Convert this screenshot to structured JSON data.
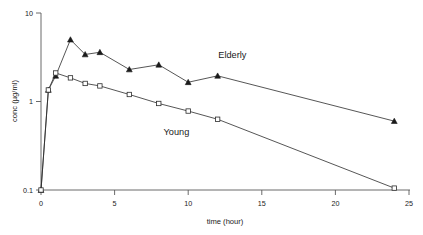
{
  "chart_data": {
    "type": "line",
    "title": "",
    "xlabel": "time (hour)",
    "ylabel": "conc (µg/ml)",
    "yscale": "log",
    "xscale": "linear",
    "xlim": [
      0,
      25
    ],
    "ylim": [
      0.1,
      10
    ],
    "xticks": [
      0,
      5,
      10,
      15,
      20,
      25
    ],
    "xticklabels": [
      "0",
      "5",
      "10",
      "15",
      "20",
      "25"
    ],
    "yticks": [
      0.1,
      1,
      10
    ],
    "yticklabels": [
      "0.1",
      "1",
      "10"
    ],
    "grid": false,
    "legend_position": "inline-annotation",
    "series": [
      {
        "name": "Elderly",
        "marker": "filled-triangle",
        "label_x": 13.0,
        "label_y": 3.1,
        "x": [
          0,
          0.5,
          1,
          2,
          3,
          4,
          6,
          8,
          10,
          12,
          24
        ],
        "values": [
          0.1,
          1.35,
          1.95,
          5.0,
          3.4,
          3.6,
          2.3,
          2.6,
          1.65,
          1.95,
          0.6
        ]
      },
      {
        "name": "Young",
        "marker": "open-square",
        "label_x": 9.2,
        "label_y": 0.42,
        "x": [
          0,
          0.5,
          1,
          2,
          3,
          4,
          6,
          8,
          10,
          12,
          24
        ],
        "values": [
          0.1,
          1.35,
          2.1,
          1.85,
          1.6,
          1.5,
          1.2,
          0.95,
          0.78,
          0.63,
          0.105
        ]
      }
    ]
  },
  "labels": {
    "elderly": "Elderly",
    "young": "Young",
    "x_axis_title": "time (hour)",
    "y_axis_title": "conc (µg/ml)",
    "ytick_10": "10",
    "ytick_1": "1",
    "ytick_0_1": "0.1",
    "xtick_0": "0",
    "xtick_5": "5",
    "xtick_10": "10",
    "xtick_15": "15",
    "xtick_20": "20",
    "xtick_25": "25"
  },
  "colors": {
    "axis": "#5a5a5a",
    "line": "#2b2b2b",
    "marker_fill": "#1a1a1a",
    "marker_open_fill": "#ffffff",
    "text": "#1a1a1a",
    "background": "#ffffff"
  }
}
